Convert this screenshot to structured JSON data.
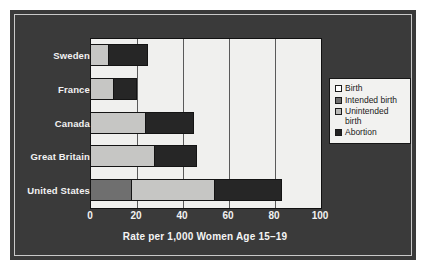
{
  "chart_data": {
    "type": "bar",
    "orientation": "horizontal",
    "stacked": true,
    "title": "",
    "xlabel": "Rate per 1,000 Women Age 15–19",
    "ylabel": "",
    "xlim": [
      0,
      100
    ],
    "xticks": [
      0,
      20,
      40,
      60,
      80,
      100
    ],
    "xtick_labels": [
      "0",
      "20",
      "40",
      "60",
      "80",
      "100"
    ],
    "grid": true,
    "grid_axis": "x",
    "legend_position": "right",
    "categories": [
      "Sweden",
      "France",
      "Canada",
      "Great Britain",
      "United States"
    ],
    "series": [
      {
        "name": "Birth",
        "key": "birth",
        "color": "#ffffff",
        "values": [
          0,
          0,
          0,
          0,
          0
        ]
      },
      {
        "name": "Intended birth",
        "key": "intended_birth",
        "color": "#6f6f6f",
        "values": [
          0,
          0,
          0,
          0,
          18
        ]
      },
      {
        "name": "Unintended birth",
        "key": "unintended_birth",
        "color": "#c6c6c4",
        "values": [
          8,
          10,
          24,
          28,
          36
        ]
      },
      {
        "name": "Abortion",
        "key": "abortion",
        "color": "#262626",
        "values": [
          17,
          10,
          21,
          18,
          29
        ]
      }
    ],
    "totals": [
      25,
      20,
      45,
      46,
      83
    ],
    "segment_breakpoints": {
      "Sweden": [
        {
          "series": "Unintended birth",
          "start": 0,
          "end": 8
        },
        {
          "series": "Abortion",
          "start": 8,
          "end": 25
        }
      ],
      "France": [
        {
          "series": "Unintended birth",
          "start": 0,
          "end": 10
        },
        {
          "series": "Abortion",
          "start": 10,
          "end": 20
        }
      ],
      "Canada": [
        {
          "series": "Unintended birth",
          "start": 0,
          "end": 24
        },
        {
          "series": "Abortion",
          "start": 24,
          "end": 45
        }
      ],
      "Great Britain": [
        {
          "series": "Unintended birth",
          "start": 0,
          "end": 28
        },
        {
          "series": "Abortion",
          "start": 28,
          "end": 46
        }
      ],
      "United States": [
        {
          "series": "Intended birth",
          "start": 0,
          "end": 18
        },
        {
          "series": "Unintended birth",
          "start": 18,
          "end": 54
        },
        {
          "series": "Abortion",
          "start": 54,
          "end": 83
        }
      ]
    }
  },
  "legend": {
    "items": [
      {
        "label": "Birth",
        "swatch": "legend-swatch-birth"
      },
      {
        "label": "Intended birth",
        "swatch": "legend-swatch-intended-birth"
      },
      {
        "label": "Unintended birth",
        "swatch": "legend-swatch-unintended-birth"
      },
      {
        "label": "Abortion",
        "swatch": "legend-swatch-abortion"
      }
    ]
  },
  "colors": {
    "panel_background": "#3a3a3a",
    "plot_background": "#f0f0ee",
    "axis_text": "#f2f2f2",
    "gridline": "#5a5a5a",
    "birth": "#ffffff",
    "intended_birth": "#6f6f6f",
    "unintended_birth": "#c6c6c4",
    "abortion": "#262626"
  }
}
